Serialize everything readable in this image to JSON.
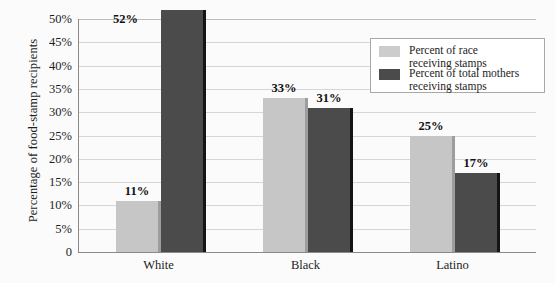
{
  "chart_data": {
    "type": "bar",
    "title": "",
    "xlabel": "",
    "ylabel": "Percentage of food-stamp recipients",
    "categories": [
      "White",
      "Black",
      "Latino"
    ],
    "ylim": [
      0,
      50
    ],
    "ytick_labels": [
      "50%",
      "45%",
      "40%",
      "35%",
      "30%",
      "25%",
      "20%",
      "15%",
      "10%",
      "5%",
      "0"
    ],
    "ytick_values": [
      50,
      45,
      40,
      35,
      30,
      25,
      20,
      15,
      10,
      5,
      0
    ],
    "grid": true,
    "legend_position": "top-right",
    "series": [
      {
        "name": "Percent of race\nreceiving stamps",
        "color": "#c6c6c6",
        "values": [
          11,
          33,
          25
        ],
        "value_labels": [
          "11%",
          "33%",
          "25%"
        ]
      },
      {
        "name": "Percent of total mothers\nreceiving stamps",
        "color": "#4b4b4b",
        "values": [
          52,
          31,
          17
        ],
        "value_labels": [
          "52%",
          "31%",
          "17%"
        ]
      }
    ]
  },
  "legend": {
    "items": [
      {
        "label": "Percent of race\nreceiving stamps",
        "swatch": "light"
      },
      {
        "label": "Percent of total mothers\nreceiving stamps",
        "swatch": "dark"
      }
    ]
  }
}
